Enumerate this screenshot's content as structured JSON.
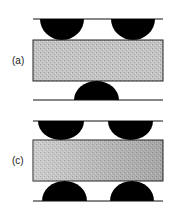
{
  "figure": {
    "panels": [
      {
        "id": "a",
        "label": "(a)",
        "description": "Specimen between two support rollers on top and one loading roller below (three-point bending)",
        "top_rollers": 2,
        "bottom_rollers": 1
      },
      {
        "id": "c",
        "label": "(c)",
        "description": "Specimen between two rollers on top and two rollers below (four-point bending)",
        "top_rollers": 2,
        "bottom_rollers": 2
      }
    ],
    "colors": {
      "roller": "#000000",
      "specimen_fill": "#bdbdbd",
      "specimen_fill_dark": "#a6a6a6",
      "line": "#111111"
    }
  }
}
